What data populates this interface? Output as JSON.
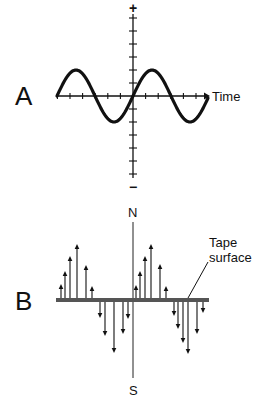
{
  "panels": {
    "a": {
      "label": "A",
      "x_axis_label": "Time",
      "y_axis_top": "+",
      "y_axis_bottom": "−",
      "wave": "sine, 2 periods, starts at zero rising"
    },
    "b": {
      "label": "B",
      "top_pole": "N",
      "bottom_pole": "S",
      "callout_line1": "Tape",
      "callout_line2": "surface"
    }
  },
  "colors": {
    "ink": "#111111",
    "tape": "#555555",
    "background": "#ffffff"
  },
  "geometry": {
    "a": {
      "origin_x": 133,
      "origin_y": 96,
      "x_start": 57,
      "x_end": 208,
      "x_tick_spacing": 12.6,
      "y_top": 14,
      "y_bottom": 178,
      "y_tick_spacing": 13,
      "amplitude": 26,
      "wave_x_start": 57,
      "wave_x_end": 208
    },
    "b": {
      "axis_x": 133,
      "axis_top": 222,
      "axis_bottom": 378,
      "tape_y": 300,
      "tape_x_start": 56,
      "tape_x_end": 209,
      "arrows": [
        {
          "x": 61,
          "tip": 284
        },
        {
          "x": 65,
          "tip": 271
        },
        {
          "x": 70,
          "tip": 256
        },
        {
          "x": 77,
          "tip": 244
        },
        {
          "x": 86,
          "tip": 265
        },
        {
          "x": 92,
          "tip": 286
        },
        {
          "x": 100,
          "tip": 318
        },
        {
          "x": 105,
          "tip": 336
        },
        {
          "x": 114,
          "tip": 353
        },
        {
          "x": 123,
          "tip": 334
        },
        {
          "x": 128,
          "tip": 319
        },
        {
          "x": 136,
          "tip": 285
        },
        {
          "x": 140,
          "tip": 271
        },
        {
          "x": 145,
          "tip": 256
        },
        {
          "x": 151,
          "tip": 244
        },
        {
          "x": 160,
          "tip": 264
        },
        {
          "x": 166,
          "tip": 286
        },
        {
          "x": 174,
          "tip": 316
        },
        {
          "x": 178,
          "tip": 329
        },
        {
          "x": 183,
          "tip": 343
        },
        {
          "x": 188,
          "tip": 354
        },
        {
          "x": 197,
          "tip": 334
        },
        {
          "x": 203,
          "tip": 313
        }
      ],
      "callout_line": {
        "x1": 188,
        "y1": 298,
        "x2": 208,
        "y2": 262
      }
    }
  }
}
